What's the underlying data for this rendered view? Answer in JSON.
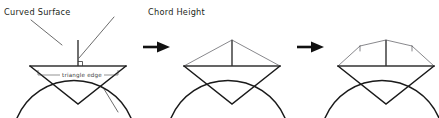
{
  "figure": {
    "background_color": "#ffffff",
    "ink_color": "#1a1a1a",
    "width": 439,
    "height": 118
  },
  "labels": {
    "curved_surface": "Curved Surface",
    "chord_height": "Chord Height",
    "triangle_edge": "triangle edge"
  },
  "stages": [
    {
      "name": "stage-1-single-triangle",
      "segments": 1,
      "annotated": true
    },
    {
      "name": "stage-2-two-triangles",
      "segments": 2,
      "annotated": false
    },
    {
      "name": "stage-3-four-triangles",
      "segments": 4,
      "annotated": false
    }
  ],
  "arrows": [
    {
      "name": "arrow-stage1-to-stage2",
      "glyph": "right-arrow"
    },
    {
      "name": "arrow-stage2-to-stage3",
      "glyph": "right-arrow"
    }
  ]
}
